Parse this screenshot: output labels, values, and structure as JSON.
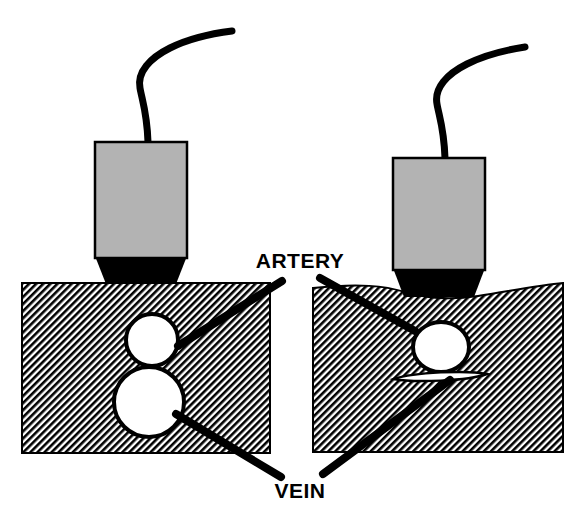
{
  "figure": {
    "background_color": "#ffffff",
    "width": 584,
    "height": 529
  },
  "colors": {
    "ink": "#000000",
    "probe_body": "#b3b3b3",
    "probe_body_stroke": "#000000",
    "probe_foot": "#000000",
    "tissue_hatch_line": "#000000",
    "tissue_hatch_background": "#ffffff",
    "vessel_lumen": "#ffffff",
    "vessel_wall": "#000000"
  },
  "labels": {
    "artery": "ARTERY",
    "vein": "VEIN"
  },
  "panels": [
    {
      "id": "left",
      "name": "no-compression",
      "probe": {
        "body": {
          "x": 95,
          "y": 142,
          "width": 92,
          "height": 116
        },
        "foot": {
          "top_y": 258,
          "bottom_y": 284,
          "top_left_x": 95,
          "top_right_x": 187,
          "bottom_left_x": 106,
          "bottom_right_x": 176
        },
        "cable": "M148,142 C147,112 142,100 140,88 C137,72 150,58 170,48 C192,37 216,33 232,31"
      },
      "tissue": {
        "x": 22,
        "y": 283,
        "width": 248,
        "height": 170,
        "top_edge": "flat"
      },
      "vessels": [
        {
          "name": "artery",
          "shape": "circle",
          "cx": 152,
          "cy": 340,
          "r": 26,
          "state": "patent"
        },
        {
          "name": "vein",
          "shape": "circle",
          "cx": 149,
          "cy": 402,
          "r": 35,
          "state": "patent"
        }
      ],
      "pointers": [
        {
          "to": "artery",
          "from_x": 282,
          "from_y": 281,
          "to_x": 178,
          "to_y": 346
        },
        {
          "to": "vein",
          "from_x": 281,
          "from_y": 477,
          "to_x": 176,
          "to_y": 414
        }
      ]
    },
    {
      "id": "right",
      "name": "with-compression",
      "probe": {
        "body": {
          "x": 393,
          "y": 158,
          "width": 92,
          "height": 112
        },
        "foot": {
          "top_y": 270,
          "bottom_y": 296,
          "top_left_x": 393,
          "top_right_x": 485,
          "bottom_left_x": 404,
          "bottom_right_x": 474
        },
        "cable": "M445,158 C444,128 439,116 437,104 C434,88 447,74 467,64 C489,53 512,49 525,47"
      },
      "tissue": {
        "x": 313,
        "y": 283,
        "width": 250,
        "height": 169,
        "top_edge": "indented"
      },
      "vessels": [
        {
          "name": "artery",
          "shape": "ellipse",
          "cx": 441,
          "cy": 347,
          "rx": 28,
          "ry": 25,
          "state": "patent"
        },
        {
          "name": "vein",
          "shape": "lens",
          "cx": 440,
          "cy": 376,
          "half_width": 47,
          "thickness": 5,
          "state": "compressed-collapsed"
        }
      ],
      "pointers": [
        {
          "to": "artery",
          "from_x": 320,
          "from_y": 278,
          "to_x": 415,
          "to_y": 331
        },
        {
          "to": "vein",
          "from_x": 323,
          "from_y": 474,
          "to_x": 450,
          "to_y": 380
        }
      ]
    }
  ],
  "annotations": {
    "artery_label_position": {
      "x": 300,
      "y": 268
    },
    "vein_label_position": {
      "x": 300,
      "y": 497
    }
  }
}
